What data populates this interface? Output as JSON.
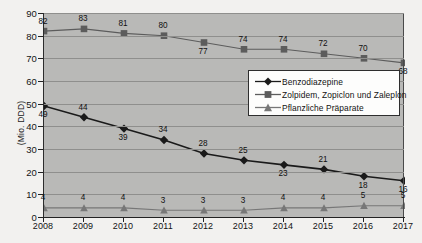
{
  "chart_data": {
    "type": "line",
    "title": "",
    "xlabel": "",
    "ylabel": "(Mio. DDD)",
    "categories": [
      "2008",
      "2009",
      "2010",
      "2011",
      "2012",
      "2013",
      "2014",
      "2015",
      "2016",
      "2017"
    ],
    "ylim": [
      0,
      90
    ],
    "yticks": [
      0,
      10,
      20,
      30,
      40,
      50,
      60,
      70,
      80,
      90
    ],
    "grid": true,
    "legend_position": "center-right-inside",
    "series": [
      {
        "name": "Benzodiazepine",
        "marker": "diamond",
        "color": "#1a1a1a",
        "values": [
          49,
          44,
          39,
          34,
          28,
          25,
          23,
          21,
          18,
          16
        ],
        "label_positions": [
          "below",
          "above",
          "below",
          "above",
          "above",
          "above",
          "below",
          "above",
          "below",
          "below"
        ]
      },
      {
        "name": "Zolpidem, Zopiclon und Zaleplon",
        "marker": "square",
        "color": "#5c5c5c",
        "values": [
          82,
          83,
          81,
          80,
          77,
          74,
          74,
          72,
          70,
          68
        ],
        "label_positions": [
          "above",
          "above",
          "above",
          "above",
          "below",
          "above",
          "above",
          "above",
          "above",
          "below"
        ]
      },
      {
        "name": "Pflanzliche Präparate",
        "marker": "triangle",
        "color": "#777777",
        "values": [
          4,
          4,
          4,
          3,
          3,
          3,
          4,
          4,
          5,
          5
        ],
        "label_positions": [
          "above",
          "above",
          "above",
          "above",
          "above",
          "above",
          "above",
          "above",
          "above",
          "above"
        ]
      }
    ]
  },
  "colors": {
    "plot_background": "#b9b9b7",
    "page_background": "#f2f1ef",
    "gridline": "#8f8f8d",
    "axis": "#232323",
    "legend_background": "#fdfdfc",
    "legend_border": "#2e2e2e"
  }
}
